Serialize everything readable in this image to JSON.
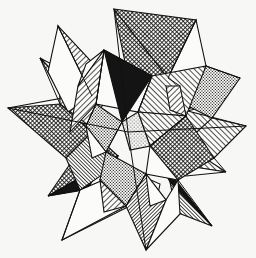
{
  "artwork": {
    "title": "Stellated Polyhedron Compound",
    "subtitle": "Pen-and-ink style geometric engraving",
    "medium": "line engraving / hatching",
    "style": "Escher-like black and white polyhedral study",
    "canvas": {
      "width": 256,
      "height": 258
    },
    "background_color": "#f7f7f6",
    "ink_color": "#111111",
    "paper_color": "#fbfbfa",
    "stroke_width": 1.1,
    "description": "A many-pointed star solid: two interpenetrating stellated polyhedra whose triangular spikes radiate from a common center. Faces are shaded with solid black, parallel diagonal hatching in two directions, fine stippling, and plain white.",
    "palette": {
      "solid_black": "#141414",
      "dark_crosshatch": "#2a2a2a",
      "hatch_line": "#181818",
      "stipple_dot": "#1d1d1d",
      "white_face": "#fbfbfa",
      "outline": "#111111"
    },
    "fill_styles": [
      {
        "id": "solid",
        "label": "solid black",
        "color": "#141414"
      },
      {
        "id": "hatch-right",
        "label": "diagonal hatch, lower-left to upper-right",
        "color": "#181818",
        "angle": -45
      },
      {
        "id": "hatch-left",
        "label": "diagonal hatch, upper-left to lower-right",
        "color": "#181818",
        "angle": 45
      },
      {
        "id": "hatch-dense",
        "label": "dense diagonal hatch",
        "color": "#181818",
        "angle": -45
      },
      {
        "id": "crosshatch",
        "label": "cross hatch",
        "color": "#1f1f1f"
      },
      {
        "id": "stipple",
        "label": "stipple dots",
        "color": "#1d1d1d"
      },
      {
        "id": "white",
        "label": "unshaded white",
        "color": "#fbfbfa"
      }
    ],
    "spike_count": 12,
    "spike_tips": [
      {
        "name": "top",
        "x": 114,
        "y": 9
      },
      {
        "name": "upper-right",
        "x": 196,
        "y": 20
      },
      {
        "name": "right-upper",
        "x": 240,
        "y": 78
      },
      {
        "name": "right",
        "x": 246,
        "y": 126
      },
      {
        "name": "right-lower",
        "x": 226,
        "y": 172
      },
      {
        "name": "lower-right",
        "x": 212,
        "y": 226
      },
      {
        "name": "bottom",
        "x": 146,
        "y": 250
      },
      {
        "name": "bottom-left",
        "x": 62,
        "y": 240
      },
      {
        "name": "lower-left",
        "x": 48,
        "y": 196
      },
      {
        "name": "left",
        "x": 8,
        "y": 108
      },
      {
        "name": "upper-left",
        "x": 40,
        "y": 58
      },
      {
        "name": "top-left",
        "x": 58,
        "y": 26
      }
    ],
    "center": {
      "x": 128,
      "y": 132
    }
  }
}
